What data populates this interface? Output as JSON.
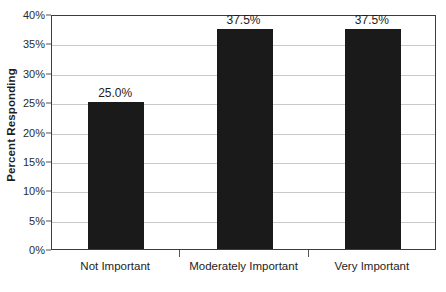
{
  "chart_data": {
    "type": "bar",
    "title": "",
    "xlabel": "",
    "ylabel": "Percent Responding",
    "categories": [
      "Not Important",
      "Moderately Important",
      "Very Important"
    ],
    "values": [
      25.0,
      37.5,
      37.5
    ],
    "data_labels": [
      "25.0%",
      "37.5%",
      "37.5%"
    ],
    "ylim": [
      0,
      40
    ],
    "ytick_values": [
      0,
      5,
      10,
      15,
      20,
      25,
      30,
      35,
      40
    ],
    "ytick_labels": [
      "0%",
      "5%",
      "10%",
      "15%",
      "20%",
      "25%",
      "30%",
      "35%",
      "40%"
    ],
    "grid": true,
    "legend": false,
    "bar_color": "#1a1a1a",
    "gridline_color": "#c9c9c9",
    "axis_color": "#3c3c3c",
    "background_color": "#ffffff"
  }
}
